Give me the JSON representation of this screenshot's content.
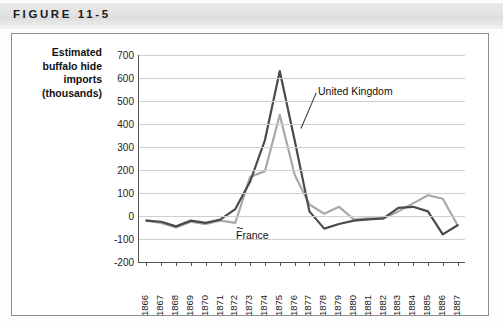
{
  "figure": {
    "label": "FIGURE 11-5"
  },
  "axis_title": {
    "line1": "Estimated",
    "line2": "buffalo hide",
    "line3": "imports",
    "line4": "(thousands)"
  },
  "colors": {
    "united_kingdom": "#4a4a4a",
    "france": "#a9a9a9",
    "grid": "#cfcfcf",
    "axis": "#555555",
    "band": "#e3e3e3"
  },
  "chart_data": {
    "type": "line",
    "title": "FIGURE 11-5",
    "xlabel": "",
    "ylabel": "Estimated buffalo hide imports (thousands)",
    "ylim": [
      -200,
      700
    ],
    "ytick_step": 100,
    "yticks": [
      700,
      600,
      500,
      400,
      300,
      200,
      100,
      0,
      -100,
      -200
    ],
    "grid": true,
    "legend_position": "inline-annotation",
    "categories": [
      "1866",
      "1867",
      "1868",
      "1869",
      "1870",
      "1871",
      "1872",
      "1873",
      "1874",
      "1875",
      "1876",
      "1877",
      "1878",
      "1879",
      "1880",
      "1881",
      "1882",
      "1883",
      "1884",
      "1885",
      "1886",
      "1887"
    ],
    "x": [
      1866,
      1867,
      1868,
      1869,
      1870,
      1871,
      1872,
      1873,
      1874,
      1875,
      1876,
      1877,
      1878,
      1879,
      1880,
      1881,
      1882,
      1883,
      1884,
      1885,
      1886,
      1887
    ],
    "series": [
      {
        "name": "United Kingdom",
        "color": "#4a4a4a",
        "values": [
          -20,
          -25,
          -45,
          -20,
          -30,
          -15,
          30,
          150,
          330,
          630,
          330,
          20,
          -55,
          -35,
          -20,
          -15,
          -10,
          35,
          40,
          20,
          -80,
          -40
        ]
      },
      {
        "name": "France",
        "color": "#a9a9a9",
        "values": [
          -20,
          -30,
          -50,
          -25,
          -35,
          -20,
          -30,
          170,
          195,
          440,
          180,
          50,
          10,
          40,
          -15,
          -10,
          -10,
          20,
          55,
          90,
          75,
          -40
        ]
      }
    ],
    "annotations": [
      {
        "text": "United Kingdom",
        "series": "United Kingdom",
        "anchor_year": 1876
      },
      {
        "text": "France",
        "series": "France",
        "anchor_year": 1872
      }
    ]
  }
}
